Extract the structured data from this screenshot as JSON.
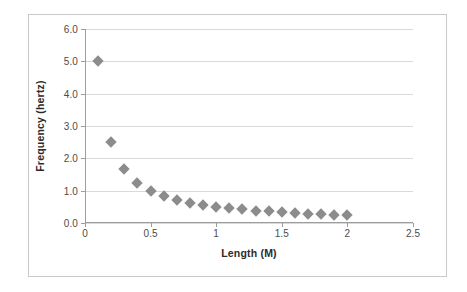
{
  "chart_data": {
    "type": "scatter",
    "title": "",
    "xlabel": "Length (M)",
    "ylabel": "Frequency (hertz)",
    "xlim": [
      0,
      2.5
    ],
    "ylim": [
      0,
      6.0
    ],
    "grid": "horizontal",
    "legend": "none",
    "marker_shape": "diamond",
    "marker_color": "#8c8c8c",
    "gridline_color": "#d9d9d9",
    "axis_color": "#9d9d9d",
    "border_color": "#c9c9c9",
    "background_color": "#ffffff",
    "xticks": [
      {
        "value": 0,
        "label": "0"
      },
      {
        "value": 0.5,
        "label": "0.5"
      },
      {
        "value": 1,
        "label": "1"
      },
      {
        "value": 1.5,
        "label": "1.5"
      },
      {
        "value": 2,
        "label": "2"
      },
      {
        "value": 2.5,
        "label": "2.5"
      }
    ],
    "yticks": [
      {
        "value": 0.0,
        "label": "0.0"
      },
      {
        "value": 1.0,
        "label": "1.0"
      },
      {
        "value": 2.0,
        "label": "2.0"
      },
      {
        "value": 3.0,
        "label": "3.0"
      },
      {
        "value": 4.0,
        "label": "4.0"
      },
      {
        "value": 5.0,
        "label": "5.0"
      },
      {
        "value": 6.0,
        "label": "6.0"
      }
    ],
    "series": [
      {
        "name": "Frequency vs Length",
        "x": [
          0.1,
          0.2,
          0.3,
          0.4,
          0.5,
          0.6,
          0.7,
          0.8,
          0.9,
          1.0,
          1.1,
          1.2,
          1.3,
          1.4,
          1.5,
          1.6,
          1.7,
          1.8,
          1.9,
          2.0
        ],
        "values": [
          5.0,
          2.5,
          1.67,
          1.25,
          1.0,
          0.83,
          0.71,
          0.63,
          0.56,
          0.5,
          0.45,
          0.42,
          0.38,
          0.36,
          0.33,
          0.31,
          0.29,
          0.28,
          0.26,
          0.25
        ]
      }
    ]
  }
}
